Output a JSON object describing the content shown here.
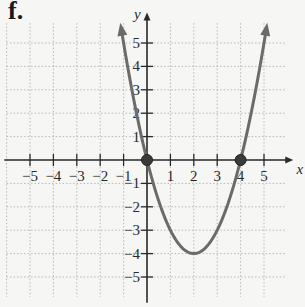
{
  "figure_label": "f.",
  "chart_data": {
    "type": "line",
    "title": "",
    "function": "y = x^2 - 4x",
    "xlabel": "x",
    "ylabel": "y",
    "xlim": [
      -6,
      6
    ],
    "ylim": [
      -6,
      6
    ],
    "grid": true,
    "x_ticks": [
      -5,
      -4,
      -3,
      -2,
      -1,
      1,
      2,
      3,
      4,
      5
    ],
    "y_ticks": [
      -5,
      -4,
      -3,
      -2,
      -1,
      1,
      2,
      3,
      4,
      5
    ],
    "x_tick_labels": [
      "−5",
      "−4",
      "−3",
      "−2",
      "−1",
      "1",
      "2",
      "3",
      "4",
      "5"
    ],
    "y_tick_labels": [
      "−5",
      "−4",
      "−3",
      "−2",
      "−1",
      "1",
      "2",
      "3",
      "4",
      "5"
    ],
    "series": [
      {
        "name": "parabola",
        "x": [
          -1.1,
          -1,
          0,
          1,
          2,
          3,
          4,
          5,
          5.1
        ],
        "y": [
          5.61,
          5,
          0,
          -3,
          -4,
          -3,
          0,
          5,
          5.61
        ],
        "arrows_at_ends": true
      }
    ],
    "marked_points": [
      {
        "x": 0,
        "y": 0,
        "label": "x-intercept"
      },
      {
        "x": 4,
        "y": 0,
        "label": "x-intercept"
      }
    ],
    "vertex": {
      "x": 2,
      "y": -4
    },
    "colors": {
      "curve": "#6b6b6b",
      "axis": "#2b2b2b",
      "grid": "#b8b8b8",
      "point": "#3a3a3a"
    }
  }
}
